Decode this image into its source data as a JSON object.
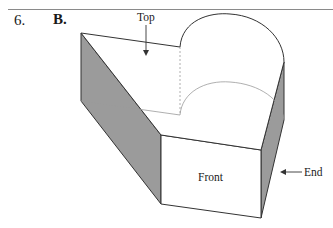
{
  "question": {
    "number": "6.",
    "answer": "B."
  },
  "figure": {
    "labels": {
      "top": "Top",
      "front": "Front",
      "end": "End"
    },
    "colors": {
      "shaded_face": "#9b9b9b",
      "edge": "#333333",
      "hidden_edge": "#9a9a9a",
      "rule": "#8a8a8a"
    }
  }
}
